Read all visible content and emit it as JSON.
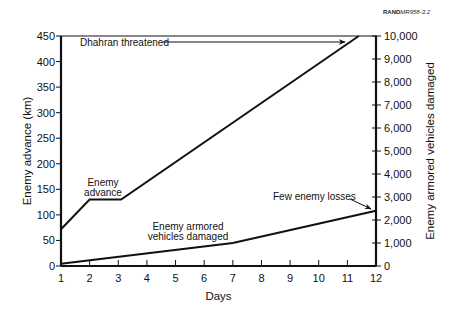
{
  "figure_ref": {
    "prefix": "RAND",
    "suffix": "MR958-3.2"
  },
  "chart_data": {
    "type": "line",
    "title": "",
    "xlabel": "Days",
    "ylabel": "Enemy advance (km)",
    "y2label": "Enemy armored vehicles damaged",
    "x_ticks": [
      1,
      2,
      3,
      4,
      5,
      6,
      7,
      8,
      9,
      10,
      11,
      12
    ],
    "xlim": [
      1,
      12
    ],
    "ylim": [
      0,
      450
    ],
    "y_ticks": [
      0,
      50,
      100,
      150,
      200,
      250,
      300,
      350,
      400,
      450
    ],
    "y2lim": [
      0,
      10000
    ],
    "y2_ticks": [
      0,
      1000,
      2000,
      3000,
      4000,
      5000,
      6000,
      7000,
      8000,
      9000,
      10000
    ],
    "y2_tick_labels": [
      "0",
      "1,000",
      "2,000",
      "3,000",
      "4,000",
      "5,000",
      "6,000",
      "7,000",
      "8,000",
      "9,000",
      "10,000"
    ],
    "grid": false,
    "series": [
      {
        "name": "Enemy advance",
        "axis": "left",
        "x": [
          1,
          2,
          3.1,
          11.4
        ],
        "y": [
          72,
          130,
          130,
          450
        ]
      },
      {
        "name": "Enemy armored vehicles damaged",
        "axis": "right",
        "x": [
          1,
          7,
          12
        ],
        "y": [
          100,
          1000,
          2400
        ]
      }
    ],
    "annotations": [
      {
        "text": "Dhahran threatened",
        "target_x": 11.1,
        "target_y": 440,
        "axis": "left"
      },
      {
        "text": "Enemy advance",
        "lines": [
          "Enemy",
          "advance"
        ]
      },
      {
        "text": "Enemy armored vehicles damaged",
        "lines": [
          "Enemy armored",
          "vehicles damaged"
        ]
      },
      {
        "text": "Few enemy losses",
        "target_x": 12,
        "target_y": 2400,
        "axis": "right"
      }
    ]
  }
}
